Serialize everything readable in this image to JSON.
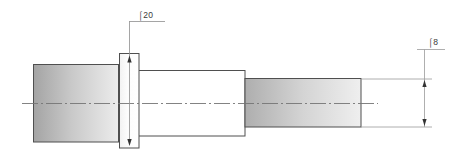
{
  "drawing": {
    "title": "Stepped shaft technical drawing",
    "background_color": "#ffffff",
    "line_color": "#4a4a4a",
    "thin_line_color": "#8c8c8c",
    "center_line_color": "#6e6e6e",
    "dimensions": [
      {
        "id": "dia-20",
        "label": "⌠20",
        "label_x": 148,
        "label_y": 16,
        "feature": "flange-outer-diameter",
        "leader": "vertical leader from label down to flange top, with arrows at flange top and bottom"
      },
      {
        "id": "dia-8",
        "label": "⌠8",
        "label_x": 437,
        "label_y": 44,
        "feature": "right-shaft-diameter",
        "leader": "vertical dimension line at right with inward arrowheads and horizontal extension lines"
      }
    ],
    "parts": [
      {
        "name": "left-cylinder",
        "x": 33,
        "y": 64,
        "width": 86,
        "height": 78,
        "fill_start": "#a6a6a6",
        "fill_end": "#e9e9e9",
        "shading": "horizontal-gradient"
      },
      {
        "name": "flange",
        "x": 119,
        "y": 53,
        "width": 20,
        "height": 95,
        "fill_start": "#f7f7f7",
        "fill_end": "#ffffff",
        "shading": "horizontal-gradient"
      },
      {
        "name": "middle-cylinder",
        "x": 139,
        "y": 70,
        "width": 106,
        "height": 66,
        "fill_start": "#ffffff",
        "fill_end": "#ffffff",
        "shading": "none"
      },
      {
        "name": "right-shaft",
        "x": 245,
        "y": 78,
        "width": 116,
        "height": 49,
        "fill_start": "#b0b0b0",
        "fill_end": "#ececec",
        "shading": "horizontal-gradient"
      }
    ],
    "center_line": {
      "name": "axis-center-line",
      "x1": 22,
      "x2": 378,
      "y": 103,
      "style": "dash-dot"
    }
  }
}
